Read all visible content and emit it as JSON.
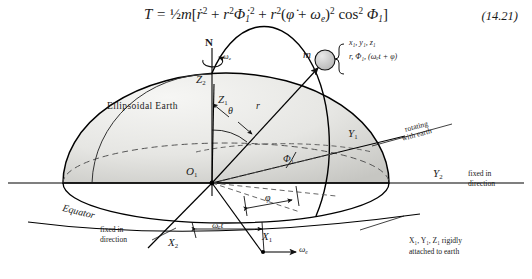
{
  "figure": {
    "equation": "T  =  ½m[ṙ² + r²Φ̇₁² + r²(φ̇ + ωₑ)² cos² Φ₁]",
    "equation_number": "(14.21)",
    "caption_body": "Ellipsoidal Earth"
  },
  "equation_parts": {
    "lhs": "T",
    "eq": "=",
    "half": "½",
    "m": "m",
    "open": "[",
    "term1": "ṙ",
    "term1_sup": "2",
    "plus1": "+",
    "term2_r": "r",
    "term2_rsup": "2",
    "term2_phi": "Φ̇",
    "term2_sub": "1",
    "term2_sup": "2",
    "plus2": "+",
    "term3_r": "r",
    "term3_rsup": "2",
    "term3_open": "(",
    "term3_phidot": "φ̇",
    "term3_plus": "+",
    "term3_omega": "ω",
    "term3_omega_sub": "e",
    "term3_close": ")",
    "term3_sup": "2",
    "cos": "cos",
    "cos_sup": "2",
    "cos_arg": "Φ",
    "cos_arg_sub": "1",
    "close": "]"
  },
  "labels": {
    "north_pole": "N",
    "omega_spin": "ω",
    "omega_spin_sub": "e",
    "z2": "Z",
    "z2_sub": "2",
    "z1": "Z",
    "z1_sub": "1",
    "mass": "m",
    "brace_line1": "x₁, y₁, z₁",
    "brace_line2": "r, Φ₁, (ωₑt + φ)",
    "ellipsoidal_earth": "Ellipsoidal Earth",
    "theta": "θ",
    "r": "r",
    "phi1": "Φ",
    "phi1_sub": "1",
    "y1": "Y",
    "y1_sub": "1",
    "y2": "Y",
    "y2_sub": "2",
    "x1": "X",
    "x1_sub": "1",
    "x2": "X",
    "x2_sub": "2",
    "rotating_with_earth_l1": "rotating",
    "rotating_with_earth_l2": "with earth",
    "fixed_in_direction_right_l1": "fixed in",
    "fixed_in_direction_right_l2": "direction",
    "fixed_in_direction_left_l1": "fixed in",
    "fixed_in_direction_left_l2": "direction",
    "equator": "Equator",
    "omega_e_t": "ωₑt",
    "phi": "φ",
    "omega_e_arrow": "ω",
    "omega_e_arrow_sub": "e",
    "rigid_note_l1": "X₁, Y₁, Z₁ rigidly",
    "rigid_note_l2": "attached to earth",
    "origin": "O",
    "origin_sub": "1"
  },
  "colors": {
    "ink": "#1a1a1a",
    "line": "#000000",
    "earth_fill_light": "#f0f0ee",
    "earth_fill_dark": "#cfcfcc",
    "mass_fill": "#c9c9c9",
    "dashed": "#4a4a4a",
    "background": "#ffffff"
  }
}
